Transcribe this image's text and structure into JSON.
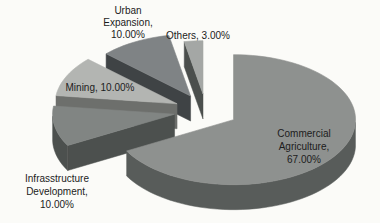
{
  "figure": {
    "kind": "scanned 3d exploded pie chart",
    "background_color": "#fbfbf8",
    "text_color": "#1c1c1c"
  },
  "chart_data": {
    "type": "pie",
    "style": "3d-exploded",
    "title": "",
    "legend": "none",
    "start_position": "top-clockwise",
    "categories": [
      "Commercial Agriculture",
      "Infrasstructure Development",
      "Mining",
      "Urban Expansion",
      "Others"
    ],
    "values": [
      67.0,
      10.0,
      10.0,
      10.0,
      3.0
    ],
    "unit": "%",
    "slices": [
      {
        "label": "Commercial Agriculture",
        "value": 67.0,
        "display": "Commercial Agriculture, 67.00%",
        "label_lines": [
          "Commercial",
          "Agriculture,",
          "67.00%"
        ],
        "color": "#8e918f",
        "side_color": "#585c5a"
      },
      {
        "label": "Infrasstructure Development",
        "value": 10.0,
        "display": "Infrasstructure Development, 10.00%",
        "label_lines": [
          "Infrasstructure",
          "Development,",
          "10.00%"
        ],
        "color": "#818583",
        "side_color": "#4c504e"
      },
      {
        "label": "Mining",
        "value": 10.0,
        "display": "Mining, 10.00%",
        "label_lines": [
          "Mining, 10.00%"
        ],
        "color": "#b3b5b2",
        "side_color": "#6d6f6c"
      },
      {
        "label": "Urban Expansion",
        "value": 10.0,
        "display": "Urban Expansion, 10.00%",
        "label_lines": [
          "Urban",
          "Expansion,",
          "10.00%"
        ],
        "color": "#7f8385",
        "side_color": "#3f4345"
      },
      {
        "label": "Others",
        "value": 3.0,
        "display": "Others, 3.00%",
        "label_lines": [
          "Others, 3.00%"
        ],
        "color": "#a4a7a5",
        "side_color": "#4b4f4d"
      }
    ]
  }
}
